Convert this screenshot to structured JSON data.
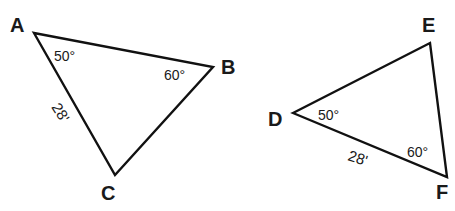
{
  "figure": {
    "stroke_color": "#111111",
    "background_color": "#ffffff"
  },
  "triangle_abc": {
    "vertices": {
      "A": "A",
      "B": "B",
      "C": "C"
    },
    "angle_a": "50°",
    "angle_b": "60°",
    "side_ac": "28'"
  },
  "triangle_def": {
    "vertices": {
      "D": "D",
      "E": "E",
      "F": "F"
    },
    "angle_d": "50°",
    "angle_f": "60°",
    "side_df": "28'"
  }
}
